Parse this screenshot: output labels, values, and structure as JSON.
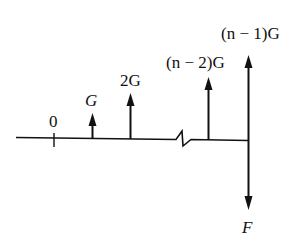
{
  "diagram": {
    "colors": {
      "ink": "#111111",
      "background": "#ffffff"
    },
    "labels": {
      "origin": "0",
      "force_1": "G",
      "force_2": "2G",
      "force_n2": "(n − 2)G",
      "force_n1": "(n − 1)G",
      "force_down": "F"
    },
    "arrows": [
      {
        "label": "G",
        "x": 92,
        "direction": "up",
        "length": 25
      },
      {
        "label": "2G",
        "x": 130,
        "direction": "up",
        "length": 46
      },
      {
        "label": "(n − 2)G",
        "x": 208,
        "direction": "up",
        "length": 63
      },
      {
        "label": "(n − 1)G",
        "x": 248,
        "direction": "up",
        "length": 85
      },
      {
        "label": "F",
        "x": 248,
        "direction": "down",
        "length": 70
      }
    ],
    "axis_break": true
  }
}
